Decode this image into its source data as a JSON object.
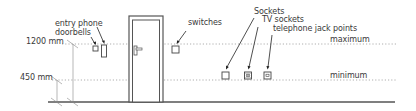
{
  "diagram": {
    "heights": [
      {
        "label": "1200 mm",
        "line_label": "maximum",
        "y": 44
      },
      {
        "label": "450 mm",
        "line_label": "minimum",
        "y": 80
      }
    ],
    "labels": {
      "entry_phone": "entry phone",
      "doorbells": "doorbells",
      "switches": "switches",
      "sockets": "Sockets",
      "tv_sockets": "TV sockets",
      "telephone_jack_points": "telephone jack points",
      "maximum": "maximum",
      "minimum": "minimum",
      "height_1200": "1200 mm",
      "height_450": "450 mm"
    },
    "colors": {
      "line": "#444444",
      "dotted": "#9a9a9a",
      "text": "#3a3a3a",
      "floor": "#555555"
    }
  }
}
